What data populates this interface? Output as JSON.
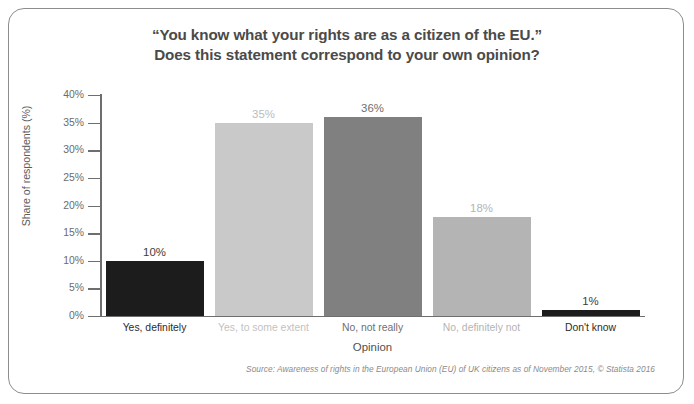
{
  "frame": {
    "border_color": "#8d8d8d"
  },
  "title": {
    "line1": "“You know what your rights are as a citizen of the EU.”",
    "line2": "Does this statement correspond to your own opinion?"
  },
  "axes": {
    "ylabel": "Share of respondents (%)",
    "xlabel": "Opinion",
    "yticks": [
      "40%",
      "35%",
      "30%",
      "25%",
      "20%",
      "15%",
      "10%",
      "5%",
      "0%"
    ]
  },
  "source": "Source: Awareness of rights in the European Union (EU) of UK citizens as of November 2015, © Statista 2016",
  "chart_data": {
    "type": "bar",
    "title": "“You know what your rights are as a citizen of the EU.” Does this statement correspond to your own opinion?",
    "xlabel": "Opinion",
    "ylabel": "Share of respondents (%)",
    "ylim": [
      0,
      40
    ],
    "ytick_values": [
      0,
      5,
      10,
      15,
      20,
      25,
      30,
      35,
      40
    ],
    "grid": false,
    "legend": false,
    "categories": [
      "Yes, definitely",
      "Yes, to some extent",
      "No, not really",
      "No, definitely not",
      "Don't know"
    ],
    "values": [
      10,
      35,
      36,
      18,
      1
    ],
    "value_labels": [
      "10%",
      "35%",
      "36%",
      "18%",
      "1%"
    ],
    "bar_colors": [
      "#1c1c1c",
      "#c9c9c9",
      "#808080",
      "#b4b4b4",
      "#1c1c1c"
    ],
    "label_colors": [
      "#3d3d3d",
      "#bcbcbc",
      "#6f6f6f",
      "#b4b4b4",
      "#3d3d3d"
    ],
    "category_label_colors": [
      "#2b2b2b",
      "#c2c2c2",
      "#6f6f6f",
      "#b4b4b4",
      "#2b2b2b"
    ]
  }
}
